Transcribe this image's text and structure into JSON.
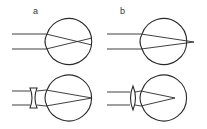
{
  "diagram": {
    "type": "refractive-errors-of-the-eye",
    "colors": {
      "line": "#2a2a2a",
      "background": "#ffffff",
      "label": "#333333"
    },
    "panels": [
      {
        "id": "a",
        "label": "a",
        "condition": "myopia",
        "focus": "in front of retina",
        "correction": "concave lens"
      },
      {
        "id": "b",
        "label": "b",
        "condition": "hyperopia",
        "focus": "behind retina",
        "correction": "convex lens"
      }
    ]
  }
}
